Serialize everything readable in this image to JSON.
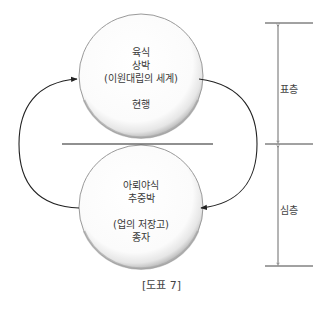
{
  "diagram": {
    "top_circle": {
      "lines": [
        "육식",
        "상박",
        "(이원대립의 세계)",
        "현행"
      ]
    },
    "bottom_circle": {
      "lines": [
        "아뢰야식",
        "추중박",
        "(업의 저장고)",
        "종자"
      ]
    },
    "layers": {
      "upper_label": "표층",
      "lower_label": "심층"
    },
    "caption": "[도표 7]",
    "colors": {
      "line": "#333333",
      "circle_edge": "#8c8c8c",
      "circle_fill": "#ffffff"
    }
  }
}
